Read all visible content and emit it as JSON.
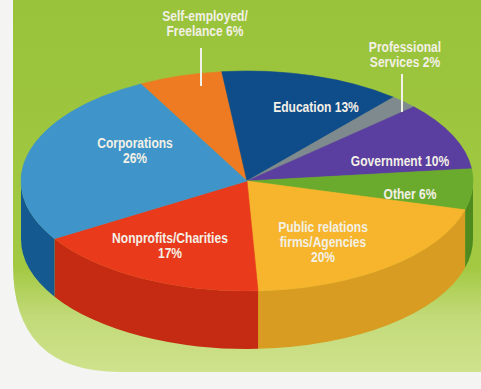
{
  "chart_data": {
    "type": "pie",
    "style": "3d-exploded-none",
    "title": "",
    "legend": "none (inline labels)",
    "unit": "%",
    "slices": [
      {
        "label": "Self-employed/ Freelance",
        "value": 6,
        "color": "#ee7a22",
        "side": "#c45f16"
      },
      {
        "label": "Education",
        "value": 13,
        "color": "#0f4c8a",
        "side": "#0b3a6c"
      },
      {
        "label": "Professional Services",
        "value": 2,
        "color": "#7e8a8e",
        "side": "#636d70"
      },
      {
        "label": "Government",
        "value": 10,
        "color": "#5a3ea0",
        "side": "#452f7d"
      },
      {
        "label": "Other",
        "value": 6,
        "color": "#6aab2e",
        "side": "#4f8a1f"
      },
      {
        "label": "Public relations firms/Agencies",
        "value": 20,
        "color": "#f6b52c",
        "side": "#d99c22"
      },
      {
        "label": "Nonprofits/Charities",
        "value": 17,
        "color": "#ea3a1c",
        "side": "#c42b12"
      },
      {
        "label": "Corporations",
        "value": 26,
        "color": "#3f95c9",
        "side": "#145a91"
      }
    ]
  },
  "labels": {
    "self_employed_1": "Self-employed/",
    "self_employed_2": "Freelance  6%",
    "professional_1": "Professional",
    "professional_2": "Services 2%",
    "education": "Education 13%",
    "government": "Government  10%",
    "other": "Other  6%",
    "pr_1": "Public relations",
    "pr_2": "firms/Agencies",
    "pr_3": "20%",
    "nonprofits_1": "Nonprofits/Charities",
    "nonprofits_2": "17%",
    "corporations_1": "Corporations",
    "corporations_2": "26%"
  },
  "colors": {
    "panel": "#9cc63a",
    "panel_bottom": "#c7dd7c",
    "page": "#f4f5f2"
  }
}
